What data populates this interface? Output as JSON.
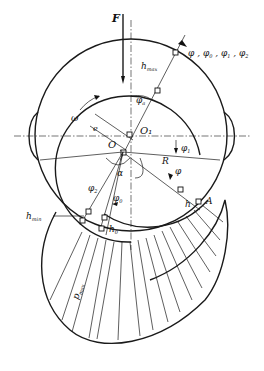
{
  "diagram": {
    "type": "journal bearing oil-film pressure distribution",
    "labels": {
      "force": "F",
      "angular_velocity": "ω",
      "eccentricity": "e",
      "bearing_center": "O",
      "journal_center": "O₁",
      "radius": "R",
      "attitude_angle": "α",
      "h_max": "h",
      "h_max_sub": "max",
      "h_min": "h",
      "h_min_sub": "min",
      "h0": "h",
      "h0_sub": "0",
      "h": "h",
      "point_A": "A",
      "phi": "φ",
      "phi_a": "φ",
      "phi_a_sub": "a",
      "phi_0": "φ",
      "phi_0_sub": "0",
      "phi_1": "φ",
      "phi_1_sub": "1",
      "phi_2": "φ",
      "phi_2_sub": "2",
      "angle_list": "φ , φ",
      "angle_list_0": "0",
      "angle_list_mid": " , φ",
      "angle_list_1": "1",
      "angle_list_end": " , φ",
      "angle_list_2": "2",
      "p_max": "p",
      "p_max_sub": "max"
    }
  }
}
